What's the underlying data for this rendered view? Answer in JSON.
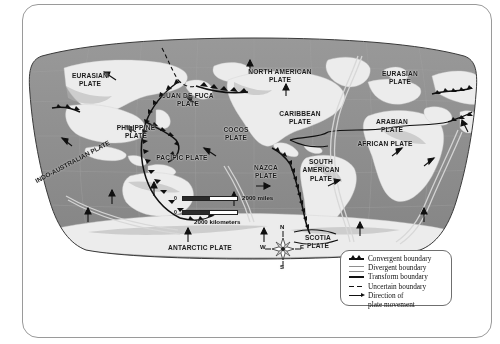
{
  "figure": {
    "kind": "world-tectonic-plates-map",
    "projection": "robinson"
  },
  "map": {
    "plate_labels": [
      {
        "name": "eurasian-plate-west",
        "text": "EURASIAN\nPLATE",
        "x": 62,
        "y": 40
      },
      {
        "name": "juan-de-fuca-plate",
        "text": "JUAN DE FUCA\nPLATE",
        "x": 159,
        "y": 60
      },
      {
        "name": "north-american-plate",
        "text": "NORTH AMERICAN\nPLATE",
        "x": 252,
        "y": 36
      },
      {
        "name": "eurasian-plate-east",
        "text": "EURASIAN\nPLATE",
        "x": 372,
        "y": 38
      },
      {
        "name": "caribbean-plate",
        "text": "CARIBBEAN\nPLATE",
        "x": 276,
        "y": 78
      },
      {
        "name": "philippine-plate",
        "text": "PHILIPPINE\nPLATE",
        "x": 110,
        "y": 92
      },
      {
        "name": "cocos-plate",
        "text": "COCOS\nPLATE",
        "x": 210,
        "y": 94
      },
      {
        "name": "arabian-plate",
        "text": "ARABIAN\nPLATE",
        "x": 365,
        "y": 86
      },
      {
        "name": "african-plate",
        "text": "AFRICAN PLATE",
        "x": 358,
        "y": 106
      },
      {
        "name": "pacific-plate",
        "text": "PACIFIC PLATE",
        "x": 152,
        "y": 122
      },
      {
        "name": "nazca-plate",
        "text": "NAZCA\nPLATE",
        "x": 238,
        "y": 132
      },
      {
        "name": "south-american-plate",
        "text": "SOUTH\nAMERICAN\nPLATE",
        "x": 293,
        "y": 130
      },
      {
        "name": "scotia-plate",
        "text": "SCOTIA\nPLATE",
        "x": 289,
        "y": 202
      },
      {
        "name": "antarctic-plate",
        "text": "ANTARCTIC PLATE",
        "x": 170,
        "y": 212
      }
    ],
    "rotated_labels": [
      {
        "name": "indo-australian-plate",
        "text": "INDO-AUSTRALIAN PLATE",
        "x": 12,
        "y": 140,
        "rotate": -28
      }
    ],
    "scale": {
      "miles_label": "2000 miles",
      "kilometers_label": "2000 kilometers",
      "zero_label": "0"
    },
    "compass": {
      "north": "N",
      "east": "E",
      "south": "S",
      "west": "W"
    }
  },
  "legend": {
    "items": [
      {
        "name": "legend-convergent",
        "symbol": "convergent-boundary-icon",
        "label": "Convergent boundary"
      },
      {
        "name": "legend-divergent",
        "symbol": "divergent-boundary-icon",
        "label": "Divergent boundary"
      },
      {
        "name": "legend-transform",
        "symbol": "transform-boundary-icon",
        "label": "Transform boundary"
      },
      {
        "name": "legend-uncertain",
        "symbol": "uncertain-boundary-icon",
        "label": "Uncertain boundary"
      },
      {
        "name": "legend-direction",
        "symbol": "direction-arrow-icon",
        "label": "Direction of\nplate movement"
      }
    ]
  },
  "colors": {
    "ocean": "#8d8d8d",
    "land": "#e9e9e9",
    "land_shadow": "#b9b9b9",
    "boundary": "#141414",
    "page_border": "#9a9a9a",
    "background": "#ffffff"
  }
}
